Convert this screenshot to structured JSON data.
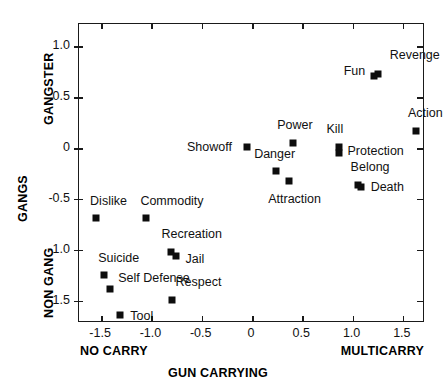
{
  "chart_data": {
    "type": "scatter",
    "title": "",
    "xlabel": "GUN CARRYING",
    "ylabel": "GANGS",
    "xlabel_left": "NO CARRY",
    "xlabel_right": "MULTICARRY",
    "ylabel_top": "GANGSTER",
    "ylabel_bottom": "NON GANG",
    "xlim": [
      -1.72,
      1.72
    ],
    "ylim": [
      -1.72,
      1.22
    ],
    "grid": false,
    "legend": "none",
    "xticks": [
      -1.5,
      -1.0,
      -0.5,
      0,
      0.5,
      1.0,
      1.5
    ],
    "xticklabels": [
      "-1.5",
      "-1.0",
      "-0.5",
      "0",
      "0.5",
      "1.0",
      "1.5"
    ],
    "yticks": [
      1.0,
      0.5,
      0,
      -0.5,
      -1.0,
      -1.5
    ],
    "yticklabels": [
      "1.0",
      "0.5",
      "0",
      "-0.5",
      "-1.0",
      "-1.5"
    ],
    "marker_color": "#0d0d0d",
    "points": [
      {
        "label": "Revenge",
        "x": 1.25,
        "y": 0.73,
        "lx": 12,
        "ly": -19
      },
      {
        "label": "Fun",
        "x": 1.21,
        "y": 0.71,
        "lx": -30,
        "ly": -5
      },
      {
        "label": "Action",
        "x": 1.63,
        "y": 0.17,
        "lx": -8,
        "ly": -18
      },
      {
        "label": "Power",
        "x": 0.41,
        "y": 0.05,
        "lx": -16,
        "ly": -18
      },
      {
        "label": "Kill",
        "x": 0.86,
        "y": 0.01,
        "lx": -12,
        "ly": -18
      },
      {
        "label": "Protection",
        "x": 0.86,
        "y": -0.05,
        "lx": 9,
        "ly": -2
      },
      {
        "label": "Showoff",
        "x": -0.05,
        "y": 0.01,
        "lx": -60,
        "ly": 0
      },
      {
        "label": "Danger",
        "x": 0.24,
        "y": -0.23,
        "lx": -22,
        "ly": -17
      },
      {
        "label": "Attraction",
        "x": 0.37,
        "y": -0.32,
        "lx": -21,
        "ly": 18
      },
      {
        "label": "Belong",
        "x": 1.05,
        "y": -0.36,
        "lx": -7,
        "ly": -18
      },
      {
        "label": "Death",
        "x": 1.08,
        "y": -0.38,
        "lx": 10,
        "ly": 0
      },
      {
        "label": "Dislike",
        "x": -1.55,
        "y": -0.69,
        "lx": -6,
        "ly": -17
      },
      {
        "label": "Commodity",
        "x": -1.05,
        "y": -0.69,
        "lx": -6,
        "ly": -17
      },
      {
        "label": "Recreation",
        "x": -0.81,
        "y": -1.02,
        "lx": -9,
        "ly": -18
      },
      {
        "label": "Jail",
        "x": -0.76,
        "y": -1.06,
        "lx": 10,
        "ly": 3
      },
      {
        "label": "Suicide",
        "x": -1.47,
        "y": -1.25,
        "lx": -6,
        "ly": -17
      },
      {
        "label": "Self Defense",
        "x": -1.41,
        "y": -1.39,
        "lx": 8,
        "ly": -11
      },
      {
        "label": "Respect",
        "x": -0.8,
        "y": -1.49,
        "lx": 4,
        "ly": -18
      },
      {
        "label": "Tool",
        "x": -1.31,
        "y": -1.64,
        "lx": 10,
        "ly": 1
      }
    ]
  }
}
